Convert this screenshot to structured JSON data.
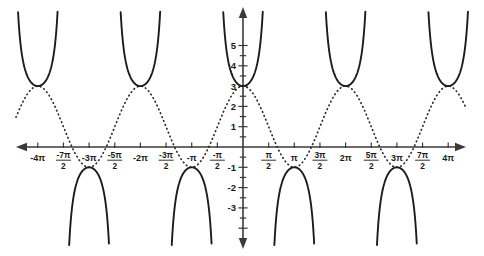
{
  "chart_data": {
    "type": "line",
    "title": "",
    "subtitle": "",
    "xlabel": "",
    "ylabel": "",
    "grid": false,
    "legend": null,
    "xlim": [
      -12.566370614,
      12.566370614
    ],
    "ylim": [
      -3.9,
      5.9
    ],
    "x_unit": "pi",
    "x_tick_values": [
      -12.566370614,
      -10.995574288,
      -9.424777961,
      -7.853981634,
      -6.283185307,
      -4.71238898,
      -3.141592654,
      -1.570796327,
      0,
      1.570796327,
      3.141592654,
      4.71238898,
      6.283185307,
      7.853981634,
      9.424777961,
      10.995574288,
      12.566370614
    ],
    "x_tick_labels": [
      {
        "text": "-4π",
        "kind": "plain"
      },
      {
        "text": "",
        "kind": "fraction",
        "num": "-7π",
        "den": "2"
      },
      {
        "text": "-3π",
        "kind": "plain"
      },
      {
        "text": "",
        "kind": "fraction",
        "num": "-5π",
        "den": "2"
      },
      {
        "text": "-2π",
        "kind": "plain"
      },
      {
        "text": "",
        "kind": "fraction",
        "num": "-3π",
        "den": "2"
      },
      {
        "text": "-π",
        "kind": "plain"
      },
      {
        "text": "",
        "kind": "fraction",
        "num": "-π",
        "den": "2"
      },
      {
        "text": "",
        "kind": "none"
      },
      {
        "text": "",
        "kind": "fraction",
        "num": "π",
        "den": "2"
      },
      {
        "text": "π",
        "kind": "plain"
      },
      {
        "text": "",
        "kind": "fraction",
        "num": "3π",
        "den": "2"
      },
      {
        "text": "2π",
        "kind": "plain"
      },
      {
        "text": "",
        "kind": "fraction",
        "num": "5π",
        "den": "2"
      },
      {
        "text": "3π",
        "kind": "plain"
      },
      {
        "text": "",
        "kind": "fraction",
        "num": "7π",
        "den": "2"
      },
      {
        "text": "4π",
        "kind": "plain"
      }
    ],
    "y_tick_values": [
      -3,
      -2,
      -1,
      1,
      2,
      3,
      4,
      5
    ],
    "y_tick_labels": [
      "-3",
      "-2",
      "-1",
      "1",
      "2",
      "3",
      "4",
      "5"
    ],
    "series": [
      {
        "name": "reference-cosine-dotted",
        "style": "dotted",
        "color": "#2a2a2a",
        "formula": "y = 1 + 2 cos(x)",
        "amplitude": 2,
        "midline": 1,
        "maximum": 3,
        "minimum": -1,
        "period_pi": 2,
        "maxima_at_x_pi": [
          -3.5,
          -1.5,
          0.5,
          2.5
        ],
        "minima_at_x_pi": [
          -2.5,
          -0.5,
          1.5,
          3.5
        ],
        "y_at_x0": 2.4
      },
      {
        "name": "secant-solid",
        "style": "solid",
        "color": "#1c1c1c",
        "formula": "y = 1 + 2 sec(x)",
        "midline": 1,
        "branch_minimum": 3,
        "branch_maximum": -1,
        "asymptotes_at_x_pi": [
          -3.5,
          -2.5,
          -1.5,
          -0.5,
          0.5,
          1.5,
          2.5,
          3.5
        ],
        "upward_vertices_x_pi": [
          -3.5,
          -1.5,
          0.5,
          2.5
        ],
        "upward_vertices_y": 3,
        "downward_vertices_x_pi": [
          -2.5,
          -0.5,
          1.5,
          3.5
        ],
        "downward_vertices_y": -1,
        "y_at_x0": 3.0
      }
    ],
    "annotations": []
  },
  "axes": {
    "x_axis_name": "horizontal-axis",
    "y_axis_name": "vertical-axis",
    "arrow_both_ends": true,
    "axis_color": "#3a3a3a"
  }
}
